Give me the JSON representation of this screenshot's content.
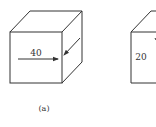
{
  "figure_a": {
    "force_label": "40",
    "caption": "(a)"
  },
  "figure_b": {
    "force_label": "20"
  },
  "colors": {
    "stroke": "#333333",
    "background": "#ffffff"
  }
}
